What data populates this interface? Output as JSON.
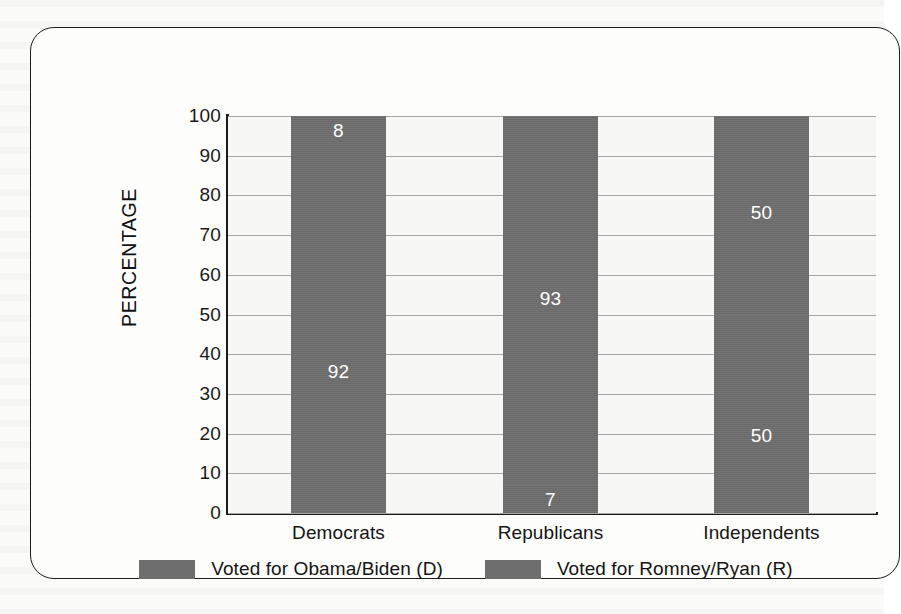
{
  "figure": {
    "frame_border_color": "#1c1c1c",
    "background_color": "#fdfdfc"
  },
  "chart_data": {
    "type": "bar",
    "subtype": "stacked-100-percent",
    "title": "",
    "xlabel": "",
    "ylabel": "PERCENTAGE",
    "ylim": [
      0,
      100
    ],
    "ytick_step": 10,
    "yticks": [
      "100",
      "90",
      "80",
      "70",
      "60",
      "50",
      "40",
      "30",
      "20",
      "10",
      "0"
    ],
    "grid": true,
    "grid_axis": "y",
    "grid_color": "#a6a6a6",
    "legend_position": "bottom-center",
    "bar_color": "#6e6e6e",
    "data_label_color": "#ffffff",
    "categories": [
      "Democrats",
      "Republicans",
      "Independents"
    ],
    "series": [
      {
        "name": "Voted for Obama/Biden (D)",
        "color": "#6e6e6e",
        "values": [
          92,
          7,
          50
        ]
      },
      {
        "name": "Voted for Romney/Ryan (R)",
        "color": "#6e6e6e",
        "values": [
          8,
          93,
          50
        ]
      }
    ],
    "bars": [
      {
        "category": "Democrats",
        "bottom_label": "92",
        "bottom_value": 92,
        "top_label": "8",
        "top_value": 8
      },
      {
        "category": "Republicans",
        "bottom_label": "7",
        "bottom_value": 7,
        "top_label": "93",
        "top_value": 93
      },
      {
        "category": "Independents",
        "bottom_label": "50",
        "bottom_value": 50,
        "top_label": "50",
        "top_value": 50
      }
    ]
  },
  "legend": {
    "items": [
      {
        "label": "Voted for Obama/Biden (D)",
        "swatch_color": "#6e6e6e"
      },
      {
        "label": "Voted for Romney/Ryan (R)",
        "swatch_color": "#6e6e6e"
      }
    ]
  }
}
